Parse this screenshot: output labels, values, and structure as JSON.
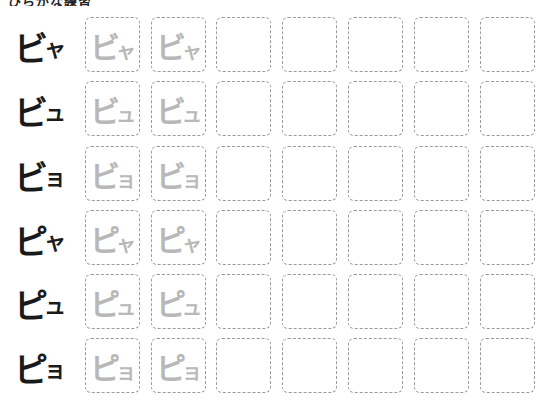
{
  "header": {
    "title": "ひらがな練習"
  },
  "grid": {
    "columns": 7,
    "trace_columns": 2,
    "rows": [
      {
        "model_main": "ピ",
        "model_small": "ャ",
        "label": "ビャ",
        "main": "ビ",
        "small": "ャ"
      },
      {
        "model_main": "ビ",
        "model_small": "ュ",
        "label": "ビュ",
        "main": "ビ",
        "small": "ュ"
      },
      {
        "model_main": "ビ",
        "model_small": "ョ",
        "label": "ビョ",
        "main": "ビ",
        "small": "ョ"
      },
      {
        "model_main": "ピ",
        "model_small": "ャ",
        "label": "ピャ",
        "main": "ピ",
        "small": "ャ"
      },
      {
        "model_main": "ピ",
        "model_small": "ュ",
        "label": "ピュ",
        "main": "ピ",
        "small": "ュ"
      },
      {
        "model_main": "ピ",
        "model_small": "ョ",
        "label": "ピョ",
        "main": "ピ",
        "small": "ョ"
      }
    ]
  },
  "colors": {
    "model_text": "#1a1a1a",
    "trace_text": "#b8b8b8",
    "cell_border": "#9a9a9a"
  }
}
